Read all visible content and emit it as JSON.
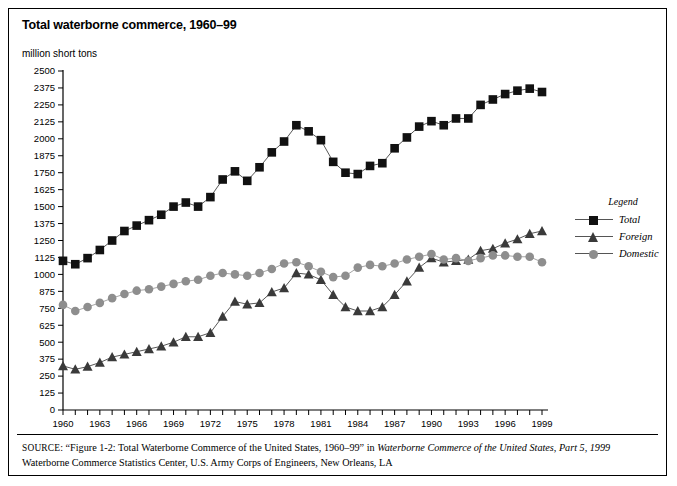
{
  "figure": {
    "title": "Total waterborne commerce, 1960–99",
    "y_unit_label": "million short tons"
  },
  "legend": {
    "title": "Legend",
    "items": [
      {
        "label": "Total",
        "marker": "square",
        "color": "#111111"
      },
      {
        "label": "Foreign",
        "marker": "triangle",
        "color": "#3a3a3a"
      },
      {
        "label": "Domestic",
        "marker": "circle",
        "color": "#8e8e8e"
      }
    ]
  },
  "source": {
    "prefix": "SOURCE",
    "part1": ": “Figure 1-2: Total Waterborne Commerce of the United States, 1960–99” in ",
    "italic1": "Waterborne Commerce of the United States, Part 5, 1999",
    "part2": " Waterborne Commerce Statistics Center, U.S. Army Corps of Engineers, New Orleans, LA"
  },
  "chart_data": {
    "type": "line",
    "title": "Total waterborne commerce, 1960–99",
    "xlabel": "",
    "ylabel": "million short tons",
    "ylim": [
      0,
      2500
    ],
    "ytick_step": 125,
    "yticks": [
      0,
      125,
      250,
      375,
      500,
      625,
      750,
      875,
      1000,
      1125,
      1250,
      1375,
      1500,
      1625,
      1750,
      1875,
      2000,
      2125,
      2250,
      2375,
      2500
    ],
    "xlim": [
      1960,
      1999
    ],
    "xticks_labeled": [
      1960,
      1963,
      1966,
      1969,
      1972,
      1975,
      1978,
      1981,
      1984,
      1987,
      1990,
      1993,
      1996,
      1999
    ],
    "xtick_step": 1,
    "grid": false,
    "legend_position": "right",
    "x": [
      1960,
      1961,
      1962,
      1963,
      1964,
      1965,
      1966,
      1967,
      1968,
      1969,
      1970,
      1971,
      1972,
      1973,
      1974,
      1975,
      1976,
      1977,
      1978,
      1979,
      1980,
      1981,
      1982,
      1983,
      1984,
      1985,
      1986,
      1987,
      1988,
      1989,
      1990,
      1991,
      1992,
      1993,
      1994,
      1995,
      1996,
      1997,
      1998,
      1999
    ],
    "series": [
      {
        "name": "Total",
        "marker": "square",
        "color": "#111111",
        "values": [
          1100,
          1075,
          1120,
          1180,
          1250,
          1320,
          1360,
          1400,
          1440,
          1500,
          1530,
          1500,
          1570,
          1700,
          1760,
          1690,
          1790,
          1900,
          1980,
          2100,
          2055,
          1990,
          1830,
          1750,
          1740,
          1800,
          1820,
          1930,
          2010,
          2090,
          2130,
          2100,
          2150,
          2150,
          2250,
          2290,
          2330,
          2355,
          2370,
          2345
        ]
      },
      {
        "name": "Foreign",
        "marker": "triangle",
        "color": "#3a3a3a",
        "values": [
          325,
          300,
          320,
          350,
          390,
          410,
          430,
          450,
          470,
          500,
          540,
          540,
          570,
          690,
          800,
          780,
          790,
          870,
          900,
          1010,
          1000,
          960,
          850,
          760,
          730,
          730,
          760,
          850,
          950,
          1050,
          1120,
          1090,
          1100,
          1110,
          1175,
          1190,
          1230,
          1260,
          1300,
          1320
        ]
      },
      {
        "name": "Domestic",
        "marker": "circle",
        "color": "#8e8e8e",
        "values": [
          775,
          730,
          760,
          790,
          825,
          855,
          880,
          890,
          910,
          930,
          950,
          960,
          990,
          1010,
          1000,
          990,
          1010,
          1040,
          1080,
          1090,
          1060,
          1020,
          980,
          990,
          1050,
          1070,
          1060,
          1080,
          1110,
          1130,
          1150,
          1110,
          1120,
          1100,
          1120,
          1140,
          1140,
          1130,
          1130,
          1090
        ]
      }
    ]
  }
}
